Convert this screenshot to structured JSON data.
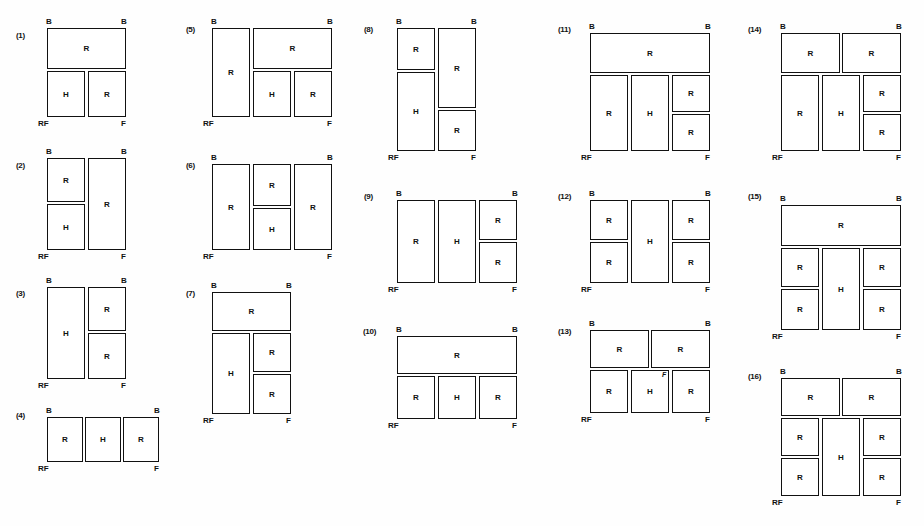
{
  "page": {
    "width": 924,
    "height": 526,
    "background": "#fefefe",
    "ink_color": "#111111"
  },
  "labels": {
    "B": "B",
    "RF": "RF",
    "F": "F",
    "R": "R",
    "H": "H",
    "stray": "F"
  },
  "figures": [
    {
      "id": "figure-1",
      "number": "(1)",
      "num_x": 16,
      "num_y": 31,
      "x": 47,
      "y": 28,
      "w": 79,
      "h": 89,
      "top_left": "B",
      "top_right": "B",
      "bottom_left": "RF",
      "bottom_right": "F",
      "cells": [
        {
          "label": "R",
          "x": 0,
          "y": 0,
          "w": 79,
          "h": 41
        },
        {
          "label": "H",
          "x": 0,
          "y": 43,
          "w": 38,
          "h": 46
        },
        {
          "label": "R",
          "x": 41,
          "y": 43,
          "w": 38,
          "h": 46
        }
      ]
    },
    {
      "id": "figure-2",
      "number": "(2)",
      "num_x": 16,
      "num_y": 161,
      "x": 47,
      "y": 158,
      "w": 79,
      "h": 92,
      "top_left": "B",
      "top_right": "B",
      "bottom_left": "RF",
      "bottom_right": "F",
      "cells": [
        {
          "label": "R",
          "x": 0,
          "y": 0,
          "w": 38,
          "h": 44
        },
        {
          "label": "H",
          "x": 0,
          "y": 46,
          "w": 38,
          "h": 46
        },
        {
          "label": "R",
          "x": 41,
          "y": 0,
          "w": 38,
          "h": 92
        }
      ]
    },
    {
      "id": "figure-3",
      "number": "(3)",
      "num_x": 16,
      "num_y": 289,
      "x": 47,
      "y": 287,
      "w": 79,
      "h": 92,
      "top_left": "B",
      "top_right": "B",
      "bottom_left": "RF",
      "bottom_right": "F",
      "cells": [
        {
          "label": "H",
          "x": 0,
          "y": 0,
          "w": 38,
          "h": 92
        },
        {
          "label": "R",
          "x": 41,
          "y": 0,
          "w": 38,
          "h": 44
        },
        {
          "label": "R",
          "x": 41,
          "y": 46,
          "w": 38,
          "h": 46
        }
      ]
    },
    {
      "id": "figure-4",
      "number": "(4)",
      "num_x": 16,
      "num_y": 411,
      "x": 47,
      "y": 417,
      "w": 112,
      "h": 45,
      "top_left": "B",
      "top_right": "B",
      "bottom_left": "RF",
      "bottom_right": "F",
      "cells": [
        {
          "label": "R",
          "x": 0,
          "y": 0,
          "w": 36,
          "h": 45
        },
        {
          "label": "H",
          "x": 38,
          "y": 0,
          "w": 36,
          "h": 45
        },
        {
          "label": "R",
          "x": 76,
          "y": 0,
          "w": 36,
          "h": 45
        }
      ]
    },
    {
      "id": "figure-5",
      "number": "(5)",
      "num_x": 186,
      "num_y": 25,
      "x": 212,
      "y": 28,
      "w": 120,
      "h": 89,
      "top_left": "B",
      "top_right": "B",
      "bottom_left": "RF",
      "bottom_right": "F",
      "cells": [
        {
          "label": "R",
          "x": 0,
          "y": 0,
          "w": 38,
          "h": 89
        },
        {
          "label": "R",
          "x": 41,
          "y": 0,
          "w": 79,
          "h": 41
        },
        {
          "label": "H",
          "x": 41,
          "y": 43,
          "w": 38,
          "h": 46
        },
        {
          "label": "R",
          "x": 82,
          "y": 43,
          "w": 38,
          "h": 46
        }
      ]
    },
    {
      "id": "figure-6",
      "number": "(6)",
      "num_x": 186,
      "num_y": 161,
      "x": 212,
      "y": 164,
      "w": 120,
      "h": 86,
      "top_left": "B",
      "top_right": "B",
      "bottom_left": "RF",
      "bottom_right": "F",
      "cells": [
        {
          "label": "R",
          "x": 0,
          "y": 0,
          "w": 38,
          "h": 86
        },
        {
          "label": "R",
          "x": 41,
          "y": 0,
          "w": 38,
          "h": 42
        },
        {
          "label": "H",
          "x": 41,
          "y": 44,
          "w": 38,
          "h": 42
        },
        {
          "label": "R",
          "x": 82,
          "y": 0,
          "w": 38,
          "h": 86
        }
      ]
    },
    {
      "id": "figure-7",
      "number": "(7)",
      "num_x": 186,
      "num_y": 289,
      "x": 212,
      "y": 292,
      "w": 79,
      "h": 122,
      "top_left": "B",
      "top_right": "B",
      "bottom_left": "RF",
      "bottom_right": "F",
      "cells": [
        {
          "label": "R",
          "x": 0,
          "y": 0,
          "w": 79,
          "h": 39
        },
        {
          "label": "H",
          "x": 0,
          "y": 41,
          "w": 38,
          "h": 81
        },
        {
          "label": "R",
          "x": 41,
          "y": 41,
          "w": 38,
          "h": 39
        },
        {
          "label": "R",
          "x": 41,
          "y": 82,
          "w": 38,
          "h": 40
        }
      ]
    },
    {
      "id": "figure-8",
      "number": "(8)",
      "num_x": 364,
      "num_y": 25,
      "x": 397,
      "y": 28,
      "w": 79,
      "h": 123,
      "top_left": "B",
      "top_right": "B",
      "bottom_left": "RF",
      "bottom_right": "F",
      "cells": [
        {
          "label": "R",
          "x": 0,
          "y": 0,
          "w": 38,
          "h": 42
        },
        {
          "label": "H",
          "x": 0,
          "y": 44,
          "w": 38,
          "h": 79
        },
        {
          "label": "R",
          "x": 41,
          "y": 0,
          "w": 38,
          "h": 80
        },
        {
          "label": "R",
          "x": 41,
          "y": 82,
          "w": 38,
          "h": 41
        }
      ]
    },
    {
      "id": "figure-9",
      "number": "(9)",
      "num_x": 364,
      "num_y": 192,
      "x": 397,
      "y": 200,
      "w": 120,
      "h": 83,
      "top_left": "B",
      "top_right": "B",
      "bottom_left": "RF",
      "bottom_right": "F",
      "cells": [
        {
          "label": "R",
          "x": 0,
          "y": 0,
          "w": 38,
          "h": 83
        },
        {
          "label": "H",
          "x": 41,
          "y": 0,
          "w": 38,
          "h": 83
        },
        {
          "label": "R",
          "x": 82,
          "y": 0,
          "w": 38,
          "h": 40
        },
        {
          "label": "R",
          "x": 82,
          "y": 42,
          "w": 38,
          "h": 41
        }
      ]
    },
    {
      "id": "figure-10",
      "number": "(10)",
      "num_x": 363,
      "num_y": 327,
      "x": 397,
      "y": 336,
      "w": 120,
      "h": 83,
      "top_left": "B",
      "top_right": "B",
      "bottom_left": "RF",
      "bottom_right": "F",
      "cells": [
        {
          "label": "R",
          "x": 0,
          "y": 0,
          "w": 120,
          "h": 38
        },
        {
          "label": "R",
          "x": 0,
          "y": 40,
          "w": 38,
          "h": 43
        },
        {
          "label": "H",
          "x": 41,
          "y": 40,
          "w": 38,
          "h": 43
        },
        {
          "label": "R",
          "x": 82,
          "y": 40,
          "w": 38,
          "h": 43
        }
      ]
    },
    {
      "id": "figure-11",
      "number": "(11)",
      "num_x": 558,
      "num_y": 25,
      "x": 590,
      "y": 33,
      "w": 120,
      "h": 118,
      "top_left": "B",
      "top_right": "B",
      "bottom_left": "RF",
      "bottom_right": "F",
      "cells": [
        {
          "label": "R",
          "x": 0,
          "y": 0,
          "w": 120,
          "h": 40
        },
        {
          "label": "R",
          "x": 0,
          "y": 42,
          "w": 38,
          "h": 76
        },
        {
          "label": "H",
          "x": 41,
          "y": 42,
          "w": 38,
          "h": 76
        },
        {
          "label": "R",
          "x": 82,
          "y": 42,
          "w": 38,
          "h": 37
        },
        {
          "label": "R",
          "x": 82,
          "y": 81,
          "w": 38,
          "h": 37
        }
      ]
    },
    {
      "id": "figure-12",
      "number": "(12)",
      "num_x": 558,
      "num_y": 192,
      "x": 590,
      "y": 200,
      "w": 120,
      "h": 83,
      "top_left": "B",
      "top_right": "B",
      "bottom_left": "RF",
      "bottom_right": "F",
      "cells": [
        {
          "label": "R",
          "x": 0,
          "y": 0,
          "w": 38,
          "h": 40
        },
        {
          "label": "R",
          "x": 0,
          "y": 42,
          "w": 38,
          "h": 41
        },
        {
          "label": "H",
          "x": 41,
          "y": 0,
          "w": 38,
          "h": 83
        },
        {
          "label": "R",
          "x": 82,
          "y": 0,
          "w": 38,
          "h": 40
        },
        {
          "label": "R",
          "x": 82,
          "y": 42,
          "w": 38,
          "h": 41
        }
      ]
    },
    {
      "id": "figure-13",
      "number": "(13)",
      "num_x": 558,
      "num_y": 327,
      "x": 590,
      "y": 330,
      "w": 120,
      "h": 83,
      "top_left": "B",
      "top_right": "B",
      "bottom_left": "RF",
      "bottom_right": "F",
      "stray_mark": {
        "label": "F",
        "x": 72,
        "y": 41
      },
      "cells": [
        {
          "label": "R",
          "x": 0,
          "y": 0,
          "w": 59,
          "h": 38
        },
        {
          "label": "R",
          "x": 61,
          "y": 0,
          "w": 59,
          "h": 38
        },
        {
          "label": "R",
          "x": 0,
          "y": 40,
          "w": 38,
          "h": 43
        },
        {
          "label": "H",
          "x": 41,
          "y": 40,
          "w": 38,
          "h": 43
        },
        {
          "label": "R",
          "x": 82,
          "y": 40,
          "w": 38,
          "h": 43
        }
      ]
    },
    {
      "id": "figure-14",
      "number": "(14)",
      "num_x": 748,
      "num_y": 25,
      "x": 781,
      "y": 33,
      "w": 120,
      "h": 118,
      "top_left": "B",
      "top_right": "B",
      "bottom_left": "RF",
      "bottom_right": "F",
      "cells": [
        {
          "label": "R",
          "x": 0,
          "y": 0,
          "w": 59,
          "h": 40
        },
        {
          "label": "R",
          "x": 61,
          "y": 0,
          "w": 59,
          "h": 40
        },
        {
          "label": "R",
          "x": 0,
          "y": 42,
          "w": 38,
          "h": 76
        },
        {
          "label": "H",
          "x": 41,
          "y": 42,
          "w": 38,
          "h": 76
        },
        {
          "label": "R",
          "x": 82,
          "y": 42,
          "w": 38,
          "h": 37
        },
        {
          "label": "R",
          "x": 82,
          "y": 81,
          "w": 38,
          "h": 37
        }
      ]
    },
    {
      "id": "figure-15",
      "number": "(15)",
      "num_x": 748,
      "num_y": 192,
      "x": 781,
      "y": 205,
      "w": 120,
      "h": 125,
      "top_left": "B",
      "top_right": "B",
      "bottom_left": "RF",
      "bottom_right": "F",
      "cells": [
        {
          "label": "R",
          "x": 0,
          "y": 0,
          "w": 120,
          "h": 41
        },
        {
          "label": "R",
          "x": 0,
          "y": 43,
          "w": 38,
          "h": 39
        },
        {
          "label": "R",
          "x": 0,
          "y": 84,
          "w": 38,
          "h": 41
        },
        {
          "label": "H",
          "x": 41,
          "y": 43,
          "w": 38,
          "h": 82
        },
        {
          "label": "R",
          "x": 82,
          "y": 43,
          "w": 38,
          "h": 39
        },
        {
          "label": "R",
          "x": 82,
          "y": 84,
          "w": 38,
          "h": 41
        }
      ]
    },
    {
      "id": "figure-16",
      "number": "(16)",
      "num_x": 748,
      "num_y": 372,
      "x": 781,
      "y": 378,
      "w": 120,
      "h": 118,
      "top_left": "B",
      "top_right": "B",
      "bottom_left": "RF",
      "bottom_right": "F",
      "cells": [
        {
          "label": "R",
          "x": 0,
          "y": 0,
          "w": 59,
          "h": 38
        },
        {
          "label": "R",
          "x": 61,
          "y": 0,
          "w": 59,
          "h": 38
        },
        {
          "label": "R",
          "x": 0,
          "y": 40,
          "w": 38,
          "h": 38
        },
        {
          "label": "R",
          "x": 0,
          "y": 80,
          "w": 38,
          "h": 38
        },
        {
          "label": "H",
          "x": 41,
          "y": 40,
          "w": 38,
          "h": 78
        },
        {
          "label": "R",
          "x": 82,
          "y": 40,
          "w": 38,
          "h": 38
        },
        {
          "label": "R",
          "x": 82,
          "y": 80,
          "w": 38,
          "h": 38
        }
      ]
    }
  ]
}
